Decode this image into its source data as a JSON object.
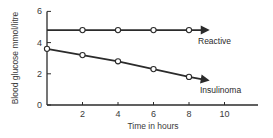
{
  "chart_data": {
    "type": "line",
    "title": "",
    "xlabel": "Time in hours",
    "ylabel": "Blood glucose mmol/litre",
    "xlim": [
      0,
      11.5
    ],
    "ylim": [
      0,
      6
    ],
    "x_ticks": [
      2,
      4,
      6,
      8,
      10
    ],
    "x_tick_labels": [
      "2",
      "4",
      "6",
      "8",
      "10"
    ],
    "y_ticks": [
      0,
      2,
      4,
      6
    ],
    "y_tick_labels": [
      "0",
      "2",
      "4",
      "6"
    ],
    "grid": false,
    "legend": "inline labels near line ends",
    "series": [
      {
        "name": "Reactive",
        "x": [
          2,
          4,
          6,
          8
        ],
        "values": [
          4.8,
          4.8,
          4.8,
          4.8
        ],
        "line_start": {
          "x": 0,
          "y": 4.8
        },
        "arrow_end": {
          "x": 9,
          "y": 4.8
        },
        "marker": "open-circle"
      },
      {
        "name": "Insulinoma",
        "x": [
          0,
          2,
          4,
          6,
          8
        ],
        "values": [
          3.6,
          3.2,
          2.8,
          2.3,
          1.8
        ],
        "arrow_end": {
          "x": 9,
          "y": 1.6
        },
        "marker": "open-circle"
      }
    ]
  }
}
